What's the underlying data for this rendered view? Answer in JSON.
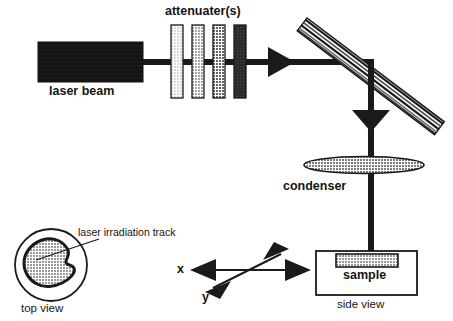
{
  "figure": {
    "width": 453,
    "height": 321,
    "background": "#ffffff"
  },
  "labels": {
    "attenuators": "attenuater(s)",
    "laser_beam": "laser beam",
    "condenser": "condenser",
    "sample": "sample",
    "side_view": "side view",
    "top_view": "top view",
    "laser_irradiation_track": "laser irradiation track",
    "axis_x": "x",
    "axis_y": "y"
  },
  "colors": {
    "stroke": "#1a1a1a",
    "laser_box_fill": "#141414",
    "attenuator_1": "#d9d9d9",
    "attenuator_2": "#a6a6a6",
    "attenuator_3": "#636363",
    "attenuator_4": "#2b2b2b",
    "condenser_fill": "#8c8c8c",
    "sample_fill": "#9a9a9a",
    "track_fill": "#9e9e9e",
    "mirror_light": "#ffffff",
    "mirror_dark": "#1a1a1a",
    "background": "#ffffff"
  },
  "components": {
    "laser_source": {
      "name": "laser beam source box",
      "x": 38,
      "y": 42,
      "width": 105,
      "height": 40,
      "fill": "#141414"
    },
    "attenuators": [
      {
        "index": 1,
        "x": 171,
        "y": 25,
        "width": 12,
        "height": 73,
        "fill": "#d9d9d9"
      },
      {
        "index": 2,
        "x": 192,
        "y": 25,
        "width": 12,
        "height": 73,
        "fill": "#a6a6a6"
      },
      {
        "index": 3,
        "x": 213,
        "y": 25,
        "width": 12,
        "height": 73,
        "fill": "#636363"
      },
      {
        "index": 4,
        "x": 234,
        "y": 25,
        "width": 12,
        "height": 73,
        "fill": "#2b2b2b"
      }
    ],
    "horizontal_beam": {
      "x1": 143,
      "x2": 371,
      "y": 62,
      "thickness": 6
    },
    "beam_arrowhead": {
      "x": 268,
      "y": 62,
      "direction": "right"
    },
    "mirror": {
      "name": "tilted striped mirror",
      "x1": 307,
      "y1": 18,
      "x2": 442,
      "y2": 120,
      "thickness": 15,
      "stripes": 5
    },
    "vertical_beam": {
      "x": 371,
      "y1": 62,
      "y2": 248,
      "thickness": 6
    },
    "vertical_arrowhead": {
      "x": 371,
      "y": 112,
      "direction": "down"
    },
    "condenser": {
      "name": "condenser lens",
      "cx": 364,
      "cy": 165,
      "rx": 60,
      "ry": 8,
      "fill": "#8c8c8c"
    },
    "sample_container": {
      "name": "sample holder box",
      "x": 316,
      "y": 251,
      "width": 101,
      "height": 44
    },
    "sample_block": {
      "x": 336,
      "y": 254,
      "width": 62,
      "height": 13,
      "fill": "#9a9a9a"
    },
    "top_view_circle": {
      "cx": 51,
      "cy": 265,
      "r": 36
    },
    "irradiation_track": {
      "name": "irregular irradiation track blob",
      "fill": "#9e9e9e"
    },
    "leader_line": {
      "x1": 58,
      "y1": 263,
      "x2": 96,
      "y2": 240
    },
    "axis_x_arrow": {
      "x1": 192,
      "x2": 309,
      "y": 270,
      "double_headed": true
    },
    "axis_y_arrow": {
      "x1": 207,
      "y1": 292,
      "x2": 287,
      "y2": 251,
      "double_headed": true
    }
  }
}
